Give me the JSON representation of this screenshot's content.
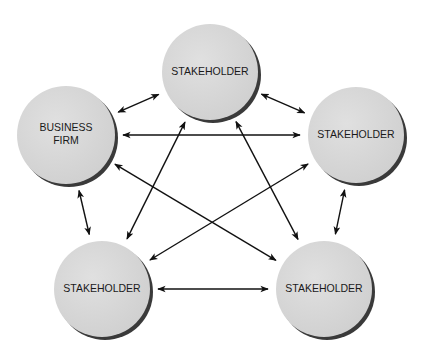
{
  "diagram": {
    "type": "stakeholder-network",
    "colors": {
      "node_fill": "#d6d6d6",
      "node_shadow": "#3a3a3a",
      "arrow": "#111111",
      "text": "#1a1a1a",
      "background": "#ffffff"
    },
    "nodes": [
      {
        "id": "top",
        "lines": [
          "STAKEHOLDER"
        ]
      },
      {
        "id": "business-firm",
        "lines": [
          "BUSINESS",
          "FIRM"
        ]
      },
      {
        "id": "right",
        "lines": [
          "STAKEHOLDER"
        ]
      },
      {
        "id": "bottom-left",
        "lines": [
          "STAKEHOLDER"
        ]
      },
      {
        "id": "bottom-right",
        "lines": [
          "STAKEHOLDER"
        ]
      }
    ],
    "edges": [
      {
        "from": "business-firm",
        "to": "top",
        "bidirectional": true
      },
      {
        "from": "top",
        "to": "right",
        "bidirectional": true
      },
      {
        "from": "business-firm",
        "to": "right",
        "bidirectional": true
      },
      {
        "from": "business-firm",
        "to": "bottom-right",
        "bidirectional": true
      },
      {
        "from": "top",
        "to": "bottom-left",
        "bidirectional": true
      },
      {
        "from": "top",
        "to": "bottom-right",
        "bidirectional": true
      },
      {
        "from": "right",
        "to": "bottom-left",
        "bidirectional": true
      },
      {
        "from": "business-firm",
        "to": "bottom-left",
        "bidirectional": true
      },
      {
        "from": "right",
        "to": "bottom-right",
        "bidirectional": true
      },
      {
        "from": "bottom-left",
        "to": "bottom-right",
        "bidirectional": true
      }
    ]
  }
}
